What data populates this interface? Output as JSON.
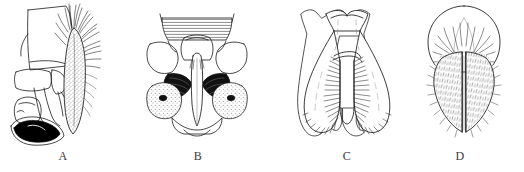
{
  "figure": {
    "background_color": "#ffffff",
    "ink_color": "#1a1a1a",
    "label_color": "#3a3a3a",
    "panel_count": 4,
    "orientation": "horizontal-row"
  },
  "panels": [
    {
      "id": "A",
      "label": "A",
      "view": "lateral",
      "description": "Lateral view of genital capsule with large smooth plate, elongate stippled setose lobe at right bearing dense apical setae, and dark sclerotized hooked process at base",
      "features": {
        "plate": "large quadrate smooth plate",
        "setose_lobe": "elongate stippled lobe with dense apical setae",
        "dark_process": "black curved hook-like sclerite",
        "shading": "stipple"
      }
    },
    {
      "id": "B",
      "label": "B",
      "view": "ventral",
      "description": "Ventral view, bilaterally symmetrical, with horizontally hatched dorsal band, paired triangular lateral plates, dark wedge-shaped patches flanking a pale median rod, and rounded stippled lateral lobes",
      "features": {
        "hatched_band": "horizontal line hatching",
        "median_rod": "pale elongate median aedeagal rod",
        "dark_patches": "paired black wedge patches",
        "lateral_lobes": "rounded stippled lobes",
        "shading": "line hatching and solid black"
      }
    },
    {
      "id": "C",
      "label": "C",
      "view": "ventral",
      "description": "Ventral view of U-shaped structure with concave dorsal margin, two broad rounded divergent lobes, and comb-like rows of stiff setae along the inner margins",
      "features": {
        "dorsal_margin": "concave with flared corners",
        "lobes": "two broad rounded divergent lobes",
        "setae": "comb-like rows of stiff setae on inner margins",
        "shading": "outline with hair lines"
      }
    },
    {
      "id": "D",
      "label": "D",
      "view": "ventral",
      "description": "Ventral view with rounded dome-shaped dorsal capsule, pointed median arch, and two elongate densely setose lobes separated by a narrow median cleft",
      "features": {
        "dome": "rounded dorsal capsule",
        "median_arch": "pointed pale median arch",
        "lobes": "two elongate densely setose lobes",
        "cleft": "narrow median cleft",
        "shading": "dense fine setae"
      }
    }
  ]
}
